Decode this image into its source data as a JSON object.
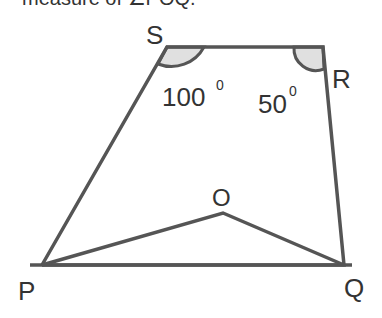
{
  "question_fragment": "measure of ∠POQ.",
  "diagram": {
    "vertices": {
      "S": {
        "label": "S",
        "x": 167,
        "y": 47
      },
      "R": {
        "label": "R",
        "x": 323,
        "y": 47
      },
      "P": {
        "label": "P",
        "x": 42,
        "y": 265
      },
      "Q": {
        "label": "Q",
        "x": 344,
        "y": 265
      },
      "O": {
        "label": "O",
        "x": 223,
        "y": 213
      }
    },
    "angles": {
      "S": {
        "value": "100",
        "unit": "0"
      },
      "R": {
        "value": "50",
        "unit": "0"
      }
    },
    "colors": {
      "line": "#555555",
      "fill": "#e0e0e0",
      "text": "#333333"
    }
  }
}
